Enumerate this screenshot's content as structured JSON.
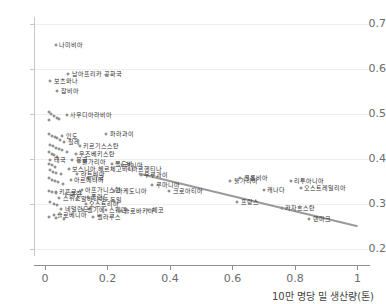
{
  "chart_data": {
    "type": "scatter",
    "title": "",
    "xlabel": "10만 명당 밀 생산량(톤)",
    "ylabel": "",
    "xlim": [
      -0.035,
      1.04
    ],
    "ylim": [
      0.185,
      0.715
    ],
    "xticks": [
      "0",
      "0.2",
      "0.4",
      "0.6",
      "0.8",
      "1"
    ],
    "xtick_values": [
      0,
      0.2,
      0.4,
      0.6,
      0.8,
      1
    ],
    "yticks": [
      "0.2",
      "0.3",
      "0.4",
      "0.5",
      "0.6",
      "0.7"
    ],
    "ytick_values": [
      0.2,
      0.3,
      0.4,
      0.5,
      0.6,
      0.7
    ],
    "grid": true,
    "legend": "none",
    "marker": "open-circle",
    "marker_color": "#6e6e6e",
    "trendline": {
      "color": "#9a9a9a",
      "width": 2,
      "x0": 0.3,
      "y0": 0.368,
      "x1": 1.0,
      "y1": 0.251
    },
    "points": [
      {
        "label": "나미비아",
        "x": 0.035,
        "y": 0.653
      },
      {
        "label": "남아프리카 공화국",
        "x": 0.075,
        "y": 0.588
      },
      {
        "label": "보츠와나",
        "x": 0.017,
        "y": 0.573
      },
      {
        "label": "잠비아",
        "x": 0.04,
        "y": 0.551
      },
      {
        "label": "사우디아라비아",
        "x": 0.07,
        "y": 0.497
      },
      {
        "label": "",
        "x": 0.012,
        "y": 0.505
      },
      {
        "label": "",
        "x": 0.02,
        "y": 0.5
      },
      {
        "label": "",
        "x": 0.028,
        "y": 0.496
      },
      {
        "label": "",
        "x": 0.037,
        "y": 0.492
      },
      {
        "label": "",
        "x": 0.046,
        "y": 0.488
      },
      {
        "label": "",
        "x": 0.014,
        "y": 0.487
      },
      {
        "label": "파라과이",
        "x": 0.196,
        "y": 0.455
      },
      {
        "label": "인도",
        "x": 0.055,
        "y": 0.452
      },
      {
        "label": "",
        "x": 0.013,
        "y": 0.456
      },
      {
        "label": "",
        "x": 0.022,
        "y": 0.452
      },
      {
        "label": "",
        "x": 0.031,
        "y": 0.449
      },
      {
        "label": "",
        "x": 0.04,
        "y": 0.446
      },
      {
        "label": "",
        "x": 0.049,
        "y": 0.443
      },
      {
        "label": "칠레",
        "x": 0.062,
        "y": 0.437
      },
      {
        "label": "키르기스스탄",
        "x": 0.112,
        "y": 0.428
      },
      {
        "label": "",
        "x": 0.015,
        "y": 0.432
      },
      {
        "label": "",
        "x": 0.025,
        "y": 0.428
      },
      {
        "label": "",
        "x": 0.034,
        "y": 0.425
      },
      {
        "label": "",
        "x": 0.044,
        "y": 0.422
      },
      {
        "label": "",
        "x": 0.054,
        "y": 0.419
      },
      {
        "label": "",
        "x": 0.07,
        "y": 0.416
      },
      {
        "label": "우즈베키스탄",
        "x": 0.098,
        "y": 0.412
      },
      {
        "label": "",
        "x": 0.012,
        "y": 0.415
      },
      {
        "label": "",
        "x": 0.021,
        "y": 0.411
      },
      {
        "label": "",
        "x": 0.03,
        "y": 0.408
      },
      {
        "label": "",
        "x": 0.04,
        "y": 0.405
      },
      {
        "label": "태국",
        "x": 0.017,
        "y": 0.397
      },
      {
        "label": "몽골",
        "x": 0.088,
        "y": 0.398
      },
      {
        "label": "불가리아",
        "x": 0.108,
        "y": 0.394
      },
      {
        "label": "몰도바",
        "x": 0.213,
        "y": 0.388
      },
      {
        "label": "러시아",
        "x": 0.246,
        "y": 0.386
      },
      {
        "label": "",
        "x": 0.013,
        "y": 0.389
      },
      {
        "label": "",
        "x": 0.023,
        "y": 0.386
      },
      {
        "label": "",
        "x": 0.033,
        "y": 0.383
      },
      {
        "label": "보스니아 헤르체고비나",
        "x": 0.076,
        "y": 0.379
      },
      {
        "label": "아르헨티나",
        "x": 0.268,
        "y": 0.378
      },
      {
        "label": "",
        "x": 0.016,
        "y": 0.375
      },
      {
        "label": "",
        "x": 0.026,
        "y": 0.372
      },
      {
        "label": "",
        "x": 0.036,
        "y": 0.369
      },
      {
        "label": "",
        "x": 0.05,
        "y": 0.367
      },
      {
        "label": "라트비아",
        "x": 0.103,
        "y": 0.366
      },
      {
        "label": "우루과이",
        "x": 0.307,
        "y": 0.364
      },
      {
        "label": "미국",
        "x": 0.139,
        "y": 0.359
      },
      {
        "label": "아르메니아",
        "x": 0.083,
        "y": 0.353
      },
      {
        "label": "",
        "x": 0.012,
        "y": 0.357
      },
      {
        "label": "",
        "x": 0.021,
        "y": 0.354
      },
      {
        "label": "",
        "x": 0.031,
        "y": 0.351
      },
      {
        "label": "",
        "x": 0.042,
        "y": 0.348
      },
      {
        "label": "",
        "x": 0.058,
        "y": 0.345
      },
      {
        "label": "불가리아",
        "x": 0.593,
        "y": 0.352
      },
      {
        "label": "콜롬비아",
        "x": 0.625,
        "y": 0.358
      },
      {
        "label": "리투아니아",
        "x": 0.786,
        "y": 0.352
      },
      {
        "label": "캐나다",
        "x": 0.7,
        "y": 0.332
      },
      {
        "label": "오스트레일리아",
        "x": 0.818,
        "y": 0.336
      },
      {
        "label": "루마니아",
        "x": 0.343,
        "y": 0.343
      },
      {
        "label": "크로아티아",
        "x": 0.398,
        "y": 0.33
      },
      {
        "label": "키프로스",
        "x": 0.034,
        "y": 0.327
      },
      {
        "label": "아프가니스탄",
        "x": 0.118,
        "y": 0.331
      },
      {
        "label": "마케도니아",
        "x": 0.22,
        "y": 0.329
      },
      {
        "label": "",
        "x": 0.013,
        "y": 0.33
      },
      {
        "label": "",
        "x": 0.024,
        "y": 0.327
      },
      {
        "label": "",
        "x": 0.035,
        "y": 0.324
      },
      {
        "label": "이란",
        "x": 0.068,
        "y": 0.322
      },
      {
        "label": "스위스",
        "x": 0.046,
        "y": 0.313
      },
      {
        "label": "폴란드",
        "x": 0.137,
        "y": 0.315
      },
      {
        "label": "알바니아",
        "x": 0.104,
        "y": 0.311
      },
      {
        "label": "독일",
        "x": 0.196,
        "y": 0.309
      },
      {
        "label": "프랑스",
        "x": 0.616,
        "y": 0.305
      },
      {
        "label": "오스트리아",
        "x": 0.131,
        "y": 0.301
      },
      {
        "label": "",
        "x": 0.016,
        "y": 0.304
      },
      {
        "label": "",
        "x": 0.028,
        "y": 0.301
      },
      {
        "label": "",
        "x": 0.04,
        "y": 0.298
      },
      {
        "label": "네덜란드",
        "x": 0.052,
        "y": 0.289
      },
      {
        "label": "벨기에",
        "x": 0.123,
        "y": 0.288
      },
      {
        "label": "스웨덴",
        "x": 0.194,
        "y": 0.286
      },
      {
        "label": "슬로바키아",
        "x": 0.243,
        "y": 0.285
      },
      {
        "label": "체코",
        "x": 0.331,
        "y": 0.286
      },
      {
        "label": "카자흐스탄",
        "x": 0.757,
        "y": 0.291
      },
      {
        "label": "슬로베니아",
        "x": 0.028,
        "y": 0.276
      },
      {
        "label": "벨라루스",
        "x": 0.154,
        "y": 0.272
      },
      {
        "label": "덴마크",
        "x": 0.845,
        "y": 0.267
      },
      {
        "label": "",
        "x": 0.014,
        "y": 0.272
      },
      {
        "label": "",
        "x": 0.034,
        "y": 0.269
      },
      {
        "label": "",
        "x": 0.06,
        "y": 0.267
      }
    ]
  }
}
